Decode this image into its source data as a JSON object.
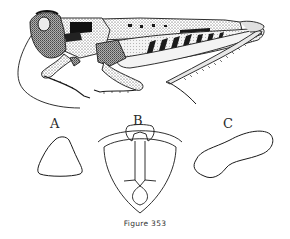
{
  "figure": {
    "caption": "Figure 353",
    "main_illustration": "grasshopper-lateral-view",
    "panels": [
      {
        "label": "A",
        "subject": "triangular outline"
      },
      {
        "label": "B",
        "subject": "ventral plate with median keel"
      },
      {
        "label": "C",
        "subject": "elongate lobed outline"
      }
    ]
  },
  "colors": {
    "ink": "#1a1a1a",
    "background": "#ffffff"
  }
}
